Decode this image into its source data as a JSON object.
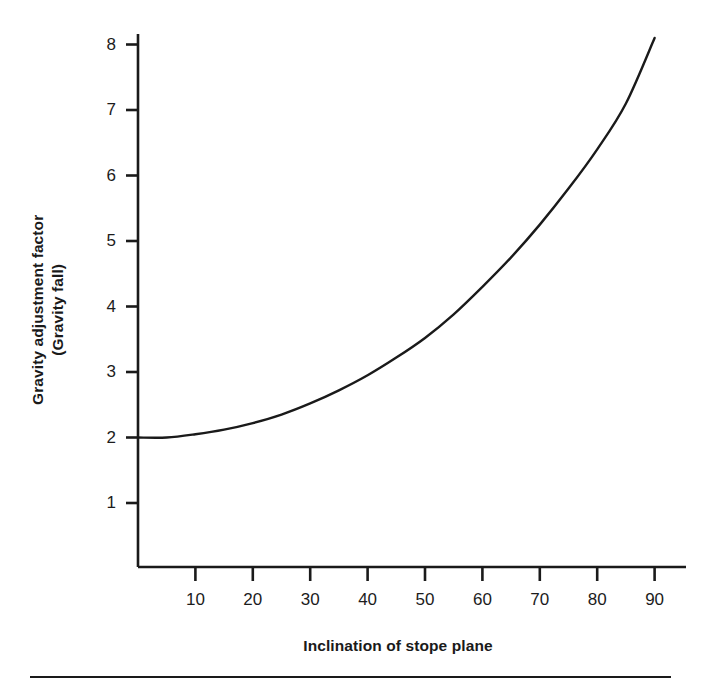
{
  "chart_data": {
    "type": "line",
    "title": "",
    "xlabel": "Inclination of stope plane",
    "ylabel_line1": "Gravity adjustment factor",
    "ylabel_line2": "(Gravity fall)",
    "xlim": [
      0,
      95
    ],
    "ylim": [
      0,
      8.4
    ],
    "grid": false,
    "legend": "none",
    "xticks": [
      10,
      20,
      30,
      40,
      50,
      60,
      70,
      80,
      90
    ],
    "xtick_labels": [
      "10",
      "20",
      "30",
      "40",
      "50",
      "60",
      "70",
      "80",
      "90"
    ],
    "yticks": [
      1,
      2,
      3,
      4,
      5,
      6,
      7,
      8
    ],
    "ytick_labels": [
      "1",
      "2",
      "3",
      "4",
      "5",
      "6",
      "7",
      "8"
    ],
    "series": [
      {
        "name": "Gravity adjustment factor",
        "color": "#1a1a1a",
        "x": [
          0,
          5,
          10,
          15,
          20,
          25,
          30,
          35,
          40,
          45,
          50,
          55,
          60,
          65,
          70,
          75,
          80,
          85,
          90
        ],
        "values": [
          2.0,
          2.0,
          2.05,
          2.12,
          2.22,
          2.35,
          2.52,
          2.72,
          2.95,
          3.22,
          3.52,
          3.88,
          4.3,
          4.75,
          5.25,
          5.8,
          6.4,
          7.1,
          8.1
        ]
      }
    ]
  },
  "axis": {
    "line_color": "#1a1a1a"
  }
}
